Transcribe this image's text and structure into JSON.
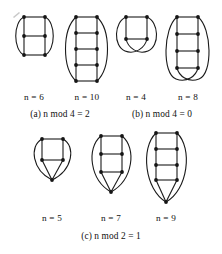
{
  "figure": {
    "background": "#ffffff",
    "ink_color": "#151515",
    "rows": [
      {
        "id": "row-1",
        "groups": [
          {
            "id": "group-a",
            "caption": "(a) n mod 4 = 2",
            "graphs": [
              {
                "id": "graph-n6",
                "label": "n = 6",
                "n": 6,
                "columns": 2,
                "rows": 3,
                "bottom_style": "curved-ends"
              },
              {
                "id": "graph-n10",
                "label": "n = 10",
                "n": 10,
                "columns": 2,
                "rows": 5,
                "bottom_style": "curved-ends"
              }
            ]
          },
          {
            "id": "group-b",
            "caption": "(b) n mod 4 = 0",
            "graphs": [
              {
                "id": "graph-n4",
                "label": "n = 4",
                "n": 4,
                "columns": 2,
                "rows": 2,
                "bottom_style": "crossed"
              },
              {
                "id": "graph-n8",
                "label": "n = 8",
                "n": 8,
                "columns": 2,
                "rows": 4,
                "bottom_style": "crossed"
              }
            ]
          }
        ]
      },
      {
        "id": "row-2",
        "groups": [
          {
            "id": "group-c",
            "caption": "(c) n mod 2 = 1",
            "graphs": [
              {
                "id": "graph-n5",
                "label": "n = 5",
                "n": 5,
                "columns": 2,
                "rows": 2,
                "bottom_style": "apex"
              },
              {
                "id": "graph-n7",
                "label": "n = 7",
                "n": 7,
                "columns": 2,
                "rows": 3,
                "bottom_style": "apex"
              },
              {
                "id": "graph-n9",
                "label": "n = 9",
                "n": 9,
                "columns": 2,
                "rows": 4,
                "bottom_style": "apex"
              }
            ]
          }
        ]
      }
    ]
  },
  "labels": {
    "n6": "n = 6",
    "n10": "n = 10",
    "n4": "n = 4",
    "n8": "n = 8",
    "n5": "n = 5",
    "n7": "n = 7",
    "n9": "n = 9"
  },
  "captions": {
    "a": "(a) n mod 4 = 2",
    "b": "(b) n mod 4 = 0",
    "c": "(c) n mod 2 = 1"
  }
}
